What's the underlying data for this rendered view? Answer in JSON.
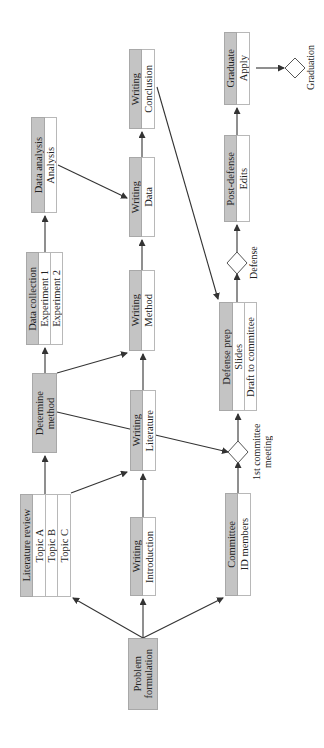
{
  "diagram": {
    "type": "flowchart",
    "orientation": "rotated-90-ccw",
    "nodes": {
      "problem": {
        "title": "Problem formulation",
        "line1": "Problem",
        "line2": "formulation"
      },
      "lit_review": {
        "title": "Literature review",
        "items": [
          "Topic A",
          "Topic B",
          "Topic C"
        ]
      },
      "writing_intro": {
        "title": "Writing",
        "items": [
          "Introduction"
        ]
      },
      "committee": {
        "title": "Committee",
        "items": [
          "ID members"
        ]
      },
      "determine_method": {
        "title": "Determine method",
        "line1": "Determine",
        "line2": "method"
      },
      "writing_lit": {
        "title": "Writing",
        "items": [
          "Literature"
        ]
      },
      "data_collection": {
        "title": "Data collection",
        "items": [
          "Experiment 1",
          "Experiment 2"
        ]
      },
      "writing_method": {
        "title": "Writing",
        "items": [
          "Method"
        ]
      },
      "defense_prep": {
        "title": "Defense prep",
        "items": [
          "Slides",
          "Draft to committee"
        ]
      },
      "data_analysis": {
        "title": "Data analysis",
        "items": [
          "Analysis"
        ]
      },
      "writing_data": {
        "title": "Writing",
        "items": [
          "Data"
        ]
      },
      "writing_conclusion": {
        "title": "Writing",
        "items": [
          "Conclusion"
        ]
      },
      "post_defense": {
        "title": "Post-defense",
        "items": [
          "Edits"
        ]
      },
      "graduate": {
        "title": "Graduate",
        "items": [
          "Apply"
        ]
      }
    },
    "milestones": {
      "first_meeting": {
        "line1": "1st committee",
        "line2": "meeting"
      },
      "defense": {
        "label": "Defense"
      },
      "graduation": {
        "label": "Graduation"
      }
    },
    "edges": [
      [
        "Problem formulation",
        "Literature review"
      ],
      [
        "Problem formulation",
        "Writing: Introduction"
      ],
      [
        "Problem formulation",
        "Committee"
      ],
      [
        "Literature review",
        "Determine method"
      ],
      [
        "Literature review",
        "Writing: Literature"
      ],
      [
        "Writing: Introduction",
        "Writing: Literature"
      ],
      [
        "Committee",
        "1st committee meeting"
      ],
      [
        "Determine method",
        "Data collection"
      ],
      [
        "Determine method",
        "Writing: Method"
      ],
      [
        "Determine method",
        "1st committee meeting"
      ],
      [
        "Writing: Literature",
        "Writing: Method"
      ],
      [
        "Writing: Literature",
        "1st committee meeting"
      ],
      [
        "Data collection",
        "Data analysis"
      ],
      [
        "Data analysis",
        "Writing: Data"
      ],
      [
        "Writing: Method",
        "Writing: Data"
      ],
      [
        "Writing: Data",
        "Writing: Conclusion"
      ],
      [
        "Writing: Conclusion",
        "Defense prep"
      ],
      [
        "1st committee meeting",
        "Defense prep"
      ],
      [
        "Defense prep",
        "Defense"
      ],
      [
        "Defense",
        "Post-defense"
      ],
      [
        "Post-defense",
        "Graduate"
      ],
      [
        "Graduate",
        "Graduation"
      ]
    ],
    "colors": {
      "header_fill": "#c4c4c4",
      "cell_fill": "#ffffff",
      "line": "#333333"
    }
  }
}
